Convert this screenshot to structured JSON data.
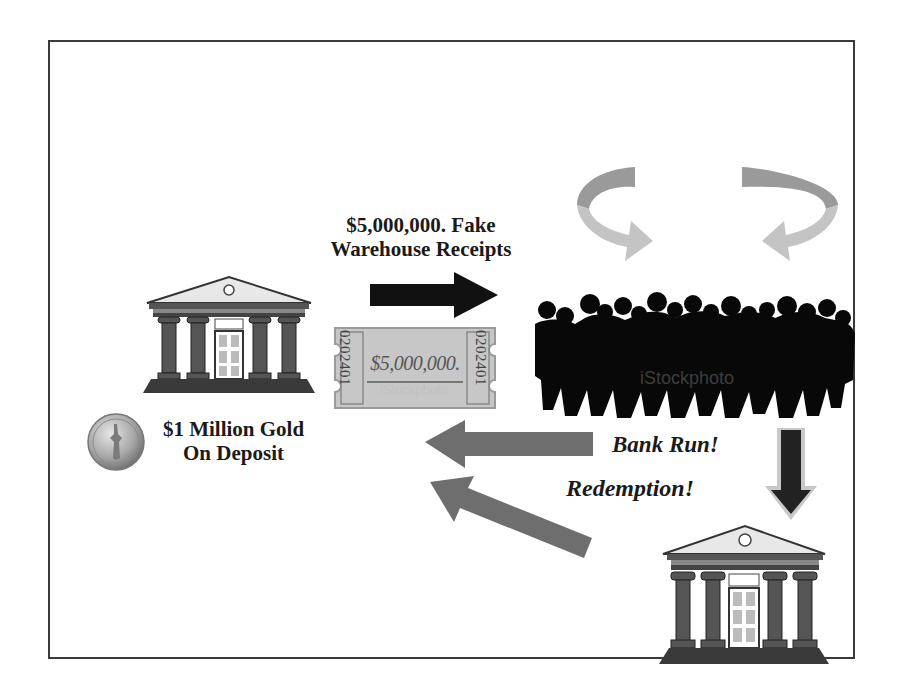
{
  "diagram": {
    "type": "flow",
    "labels": {
      "fake_receipts_line1": "$5,000,000. Fake",
      "fake_receipts_line2": "Warehouse Receipts",
      "gold_line1": "$1 Million Gold",
      "gold_line2": "On Deposit",
      "bank_run": "Bank Run!",
      "redemption": "Redemption!"
    },
    "ticket": {
      "amount": "$5,000,000.",
      "serial": "0202401",
      "watermark": "iStockphoto"
    },
    "crowd": {
      "watermark": "iStockphoto"
    },
    "nodes": [
      {
        "id": "bank-left",
        "label": "Bank"
      },
      {
        "id": "gold-coin",
        "label": "$1 Million Gold On Deposit"
      },
      {
        "id": "receipt-ticket",
        "label": "$5,000,000."
      },
      {
        "id": "crowd",
        "label": "Depositors"
      },
      {
        "id": "bank-right",
        "label": "Bank"
      }
    ],
    "edges": [
      {
        "from": "bank-left",
        "to": "crowd",
        "label": "$5,000,000. Fake Warehouse Receipts",
        "color": "#111111"
      },
      {
        "from": "crowd",
        "to": "bank-left",
        "label": "Bank Run!",
        "color": "#6e6e6e"
      },
      {
        "from": "bank-right",
        "to": "bank-left",
        "label": "Redemption!",
        "color": "#6e6e6e"
      },
      {
        "from": "crowd",
        "to": "bank-right",
        "label": "",
        "color": "#222222"
      }
    ],
    "colors": {
      "frame": "#3a3a3a",
      "dark_arrow": "#111111",
      "gray_arrow": "#6e6e6e",
      "curved_arrow_dark": "#9a9a9a",
      "curved_arrow_light": "#c4c4c4",
      "silhouette": "#080808"
    }
  }
}
